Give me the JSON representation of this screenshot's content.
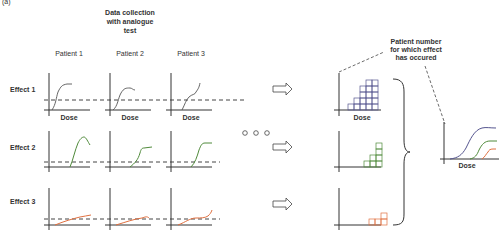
{
  "panel_label": "(a)",
  "header": {
    "line1": "Data collection",
    "line2": "with analogue",
    "line3": "test"
  },
  "patients": [
    "Patient 1",
    "Patient 2",
    "Patient 3"
  ],
  "effects": [
    "Effect 1",
    "Effect 2",
    "Effect 3"
  ],
  "axis_label": "Dose",
  "annotation": {
    "line1": "Patient number",
    "line2": "for which effect",
    "line3": "has occured"
  },
  "ellipsis": "○ ○ ○",
  "colors": {
    "effect1": "#55558f",
    "effect2": "#4f8a3a",
    "effect3": "#e07040",
    "axis": "#333333"
  },
  "histograms": {
    "effect1": [
      1,
      2,
      4,
      5,
      5
    ],
    "effect2": [
      1,
      2,
      4
    ],
    "effect3": [
      1,
      1,
      2
    ]
  }
}
